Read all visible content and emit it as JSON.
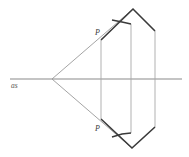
{
  "figure": {
    "background_color": "#ffffff",
    "width": 189,
    "height": 157
  },
  "colors": {
    "axis_line": "#8a8a8a",
    "thin_ray": "#9a9a9a",
    "thin_vertical": "#a8a8a8",
    "thick_outline": "#3a3a3a",
    "label": "#3a3a3a",
    "axis_label": "#555555"
  },
  "labels": {
    "axis": "as",
    "point_upper": "P",
    "point_lower": "P"
  },
  "geometry": {
    "vertex": {
      "x": 52,
      "y": 79
    },
    "axis": {
      "x1": 10,
      "y1": 79,
      "x2": 182,
      "y2": 79
    },
    "upper_ray": {
      "x1": 52,
      "y1": 79,
      "x2": 133,
      "y2": 9
    },
    "lower_ray": {
      "x1": 52,
      "y1": 79,
      "x2": 132,
      "y2": 148
    },
    "vertical_left": {
      "x": 101,
      "y1": 40,
      "y2": 119
    },
    "vertical_mid": {
      "x": 131,
      "y1": 24,
      "y2": 133
    },
    "vertical_right": {
      "x": 155,
      "y1": 31,
      "y2": 127
    },
    "upper_outline": [
      {
        "x": 101,
        "y": 40
      },
      {
        "x": 133,
        "y": 9
      },
      {
        "x": 155,
        "y": 31
      }
    ],
    "upper_notch": [
      {
        "x": 112,
        "y": 20
      },
      {
        "x": 122,
        "y": 22
      },
      {
        "x": 131,
        "y": 24
      }
    ],
    "lower_outline": [
      {
        "x": 101,
        "y": 119
      },
      {
        "x": 132,
        "y": 148
      },
      {
        "x": 155,
        "y": 127
      }
    ],
    "lower_notch": [
      {
        "x": 112,
        "y": 137
      },
      {
        "x": 122,
        "y": 134
      },
      {
        "x": 131,
        "y": 133
      }
    ],
    "label_axis_pos": {
      "x": 11,
      "y": 88
    },
    "label_upper_pos": {
      "x": 95,
      "y": 35
    },
    "label_lower_pos": {
      "x": 95,
      "y": 131
    }
  },
  "chart_data": {
    "type": "diagram",
    "elements": [
      {
        "name": "optical-axis",
        "kind": "line",
        "from": [
          10,
          79
        ],
        "to": [
          182,
          79
        ],
        "label": "as"
      },
      {
        "name": "upper-ray",
        "kind": "line",
        "from": [
          52,
          79
        ],
        "to": [
          133,
          9
        ]
      },
      {
        "name": "lower-ray",
        "kind": "line",
        "from": [
          52,
          79
        ],
        "to": [
          132,
          148
        ]
      },
      {
        "name": "vertical-left",
        "kind": "line",
        "from": [
          101,
          40
        ],
        "to": [
          101,
          119
        ]
      },
      {
        "name": "vertical-mid",
        "kind": "line",
        "from": [
          131,
          24
        ],
        "to": [
          131,
          133
        ]
      },
      {
        "name": "vertical-right",
        "kind": "line",
        "from": [
          155,
          31
        ],
        "to": [
          155,
          127
        ]
      },
      {
        "name": "upper-surface",
        "kind": "polyline",
        "points": [
          [
            101,
            40
          ],
          [
            133,
            9
          ],
          [
            155,
            31
          ]
        ]
      },
      {
        "name": "lower-surface",
        "kind": "polyline",
        "points": [
          [
            101,
            119
          ],
          [
            132,
            148
          ],
          [
            155,
            127
          ]
        ]
      },
      {
        "name": "upper-inner-notch",
        "kind": "polyline",
        "points": [
          [
            112,
            20
          ],
          [
            122,
            22
          ],
          [
            131,
            24
          ]
        ]
      },
      {
        "name": "lower-inner-notch",
        "kind": "polyline",
        "points": [
          [
            112,
            137
          ],
          [
            122,
            134
          ],
          [
            131,
            133
          ]
        ]
      }
    ],
    "annotations": [
      {
        "text": "as",
        "x": 11,
        "y": 88
      },
      {
        "text": "P",
        "x": 95,
        "y": 35
      },
      {
        "text": "P",
        "x": 95,
        "y": 131
      }
    ]
  }
}
